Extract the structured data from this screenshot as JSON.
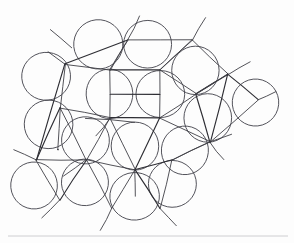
{
  "figure": {
    "background_color": "#fdfdfd",
    "stroke_color": "#3f3f46",
    "circle_stroke_color": "#4a4a52",
    "baseline_color": "#c8c8cc",
    "canvas": {
      "width": 294,
      "height": 243
    }
  },
  "chart_data": {
    "type": "scatter",
    "xlabel": "",
    "ylabel": "",
    "xlim": [
      0,
      294
    ],
    "ylim": [
      0,
      243
    ],
    "grid": false,
    "legend": false,
    "circle_radius": 24,
    "circles": [
      {
        "cx": 98,
        "cy": 44,
        "r": 24
      },
      {
        "cx": 148,
        "cy": 44,
        "r": 24
      },
      {
        "cx": 46,
        "cy": 76,
        "r": 24
      },
      {
        "cx": 196,
        "cy": 70,
        "r": 24
      },
      {
        "cx": 110,
        "cy": 94,
        "r": 24
      },
      {
        "cx": 160,
        "cy": 94,
        "r": 24
      },
      {
        "cx": 256,
        "cy": 103,
        "r": 24
      },
      {
        "cx": 48,
        "cy": 124,
        "r": 24
      },
      {
        "cx": 208,
        "cy": 118,
        "r": 24
      },
      {
        "cx": 85,
        "cy": 140,
        "r": 24
      },
      {
        "cx": 135,
        "cy": 146,
        "r": 24
      },
      {
        "cx": 185,
        "cy": 150,
        "r": 24
      },
      {
        "cx": 34,
        "cy": 185,
        "r": 24
      },
      {
        "cx": 85,
        "cy": 182,
        "r": 24
      },
      {
        "cx": 172,
        "cy": 184,
        "r": 24
      },
      {
        "cx": 135,
        "cy": 196,
        "r": 24
      }
    ],
    "lattice_edges": [
      {
        "x1": 65,
        "y1": 64,
        "x2": 128,
        "y2": 40
      },
      {
        "x1": 128,
        "y1": 40,
        "x2": 192,
        "y2": 40
      },
      {
        "x1": 192,
        "y1": 40,
        "x2": 228,
        "y2": 74
      },
      {
        "x1": 228,
        "y1": 74,
        "x2": 258,
        "y2": 100
      },
      {
        "x1": 65,
        "y1": 64,
        "x2": 60,
        "y2": 108
      },
      {
        "x1": 60,
        "y1": 108,
        "x2": 58,
        "y2": 150
      },
      {
        "x1": 58,
        "y1": 150,
        "x2": 58,
        "y2": 150
      },
      {
        "x1": 65,
        "y1": 64,
        "x2": 110,
        "y2": 70
      },
      {
        "x1": 110,
        "y1": 70,
        "x2": 128,
        "y2": 40
      },
      {
        "x1": 110,
        "y1": 70,
        "x2": 160,
        "y2": 70
      },
      {
        "x1": 160,
        "y1": 70,
        "x2": 192,
        "y2": 40
      },
      {
        "x1": 160,
        "y1": 70,
        "x2": 196,
        "y2": 94
      },
      {
        "x1": 196,
        "y1": 94,
        "x2": 228,
        "y2": 74
      },
      {
        "x1": 110,
        "y1": 70,
        "x2": 110,
        "y2": 118
      },
      {
        "x1": 160,
        "y1": 70,
        "x2": 160,
        "y2": 118
      },
      {
        "x1": 110,
        "y1": 118,
        "x2": 160,
        "y2": 118
      },
      {
        "x1": 60,
        "y1": 108,
        "x2": 110,
        "y2": 118
      },
      {
        "x1": 160,
        "y1": 118,
        "x2": 196,
        "y2": 94
      },
      {
        "x1": 196,
        "y1": 94,
        "x2": 210,
        "y2": 142
      },
      {
        "x1": 160,
        "y1": 118,
        "x2": 210,
        "y2": 142
      },
      {
        "x1": 110,
        "y1": 118,
        "x2": 135,
        "y2": 170
      },
      {
        "x1": 135,
        "y1": 170,
        "x2": 160,
        "y2": 118
      },
      {
        "x1": 60,
        "y1": 108,
        "x2": 86,
        "y2": 160
      },
      {
        "x1": 86,
        "y1": 160,
        "x2": 135,
        "y2": 170
      },
      {
        "x1": 135,
        "y1": 170,
        "x2": 172,
        "y2": 160
      },
      {
        "x1": 172,
        "y1": 160,
        "x2": 210,
        "y2": 142
      },
      {
        "x1": 86,
        "y1": 160,
        "x2": 110,
        "y2": 118
      },
      {
        "x1": 60,
        "y1": 108,
        "x2": 36,
        "y2": 160
      },
      {
        "x1": 36,
        "y1": 160,
        "x2": 86,
        "y2": 160
      },
      {
        "x1": 36,
        "y1": 160,
        "x2": 60,
        "y2": 200
      },
      {
        "x1": 60,
        "y1": 200,
        "x2": 86,
        "y2": 160
      },
      {
        "x1": 86,
        "y1": 160,
        "x2": 112,
        "y2": 208
      },
      {
        "x1": 112,
        "y1": 208,
        "x2": 135,
        "y2": 170
      },
      {
        "x1": 135,
        "y1": 170,
        "x2": 160,
        "y2": 208
      },
      {
        "x1": 160,
        "y1": 208,
        "x2": 172,
        "y2": 160
      },
      {
        "x1": 172,
        "y1": 160,
        "x2": 210,
        "y2": 142
      },
      {
        "x1": 210,
        "y1": 142,
        "x2": 228,
        "y2": 74
      },
      {
        "x1": 228,
        "y1": 74,
        "x2": 196,
        "y2": 94
      },
      {
        "x1": 258,
        "y1": 100,
        "x2": 210,
        "y2": 142
      },
      {
        "x1": 65,
        "y1": 64,
        "x2": 36,
        "y2": 160
      },
      {
        "x1": 192,
        "y1": 40,
        "x2": 160,
        "y2": 70
      },
      {
        "x1": 128,
        "y1": 40,
        "x2": 110,
        "y2": 70
      },
      {
        "x1": 110,
        "y1": 94,
        "x2": 160,
        "y2": 94
      },
      {
        "x1": 85,
        "y1": 118,
        "x2": 135,
        "y2": 122
      }
    ],
    "tangent_rays": [
      {
        "x1": 72,
        "y1": 48,
        "x2": 50,
        "y2": 30
      },
      {
        "x1": 128,
        "y1": 40,
        "x2": 140,
        "y2": 16
      },
      {
        "x1": 192,
        "y1": 40,
        "x2": 206,
        "y2": 18
      },
      {
        "x1": 228,
        "y1": 74,
        "x2": 250,
        "y2": 62
      },
      {
        "x1": 36,
        "y1": 160,
        "x2": 14,
        "y2": 150
      },
      {
        "x1": 60,
        "y1": 200,
        "x2": 42,
        "y2": 218
      },
      {
        "x1": 112,
        "y1": 208,
        "x2": 100,
        "y2": 230
      },
      {
        "x1": 160,
        "y1": 208,
        "x2": 176,
        "y2": 226
      },
      {
        "x1": 210,
        "y1": 142,
        "x2": 232,
        "y2": 134
      },
      {
        "x1": 210,
        "y1": 142,
        "x2": 224,
        "y2": 160
      },
      {
        "x1": 258,
        "y1": 100,
        "x2": 276,
        "y2": 92
      },
      {
        "x1": 86,
        "y1": 160,
        "x2": 64,
        "y2": 176
      },
      {
        "x1": 65,
        "y1": 64,
        "x2": 48,
        "y2": 52
      },
      {
        "x1": 135,
        "y1": 170,
        "x2": 135,
        "y2": 196
      },
      {
        "x1": 110,
        "y1": 118,
        "x2": 96,
        "y2": 136
      },
      {
        "x1": 196,
        "y1": 94,
        "x2": 214,
        "y2": 82
      }
    ],
    "baseline": {
      "x1": 8,
      "y1": 236,
      "x2": 288,
      "y2": 236
    }
  }
}
